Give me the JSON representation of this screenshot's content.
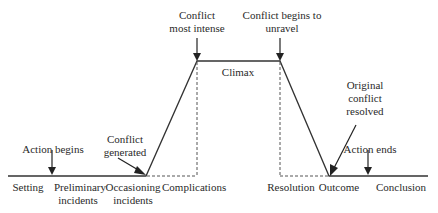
{
  "diagram": {
    "type": "plot-structure / dramatic arc",
    "annotations": {
      "action_begins": "Action begins",
      "conflict_generated_1": "Conflict",
      "conflict_generated_2": "generated",
      "conflict_most_intense_1": "Conflict",
      "conflict_most_intense_2": "most intense",
      "conflict_unravel_1": "Conflict begins to",
      "conflict_unravel_2": "unravel",
      "climax": "Climax",
      "original_resolved_1": "Original",
      "original_resolved_2": "conflict",
      "original_resolved_3": "resolved",
      "action_ends": "Action ends"
    },
    "stages": {
      "setting": "Setting",
      "preliminary_1": "Preliminary",
      "preliminary_2": "incidents",
      "occasioning_1": "Occasioning",
      "occasioning_2": "incidents",
      "complications": "Complications",
      "resolution": "Resolution",
      "outcome": "Outcome",
      "conclusion": "Conclusion"
    },
    "colors": {
      "line": "#333333",
      "text": "#2a2a2a",
      "background": "#ffffff"
    }
  }
}
